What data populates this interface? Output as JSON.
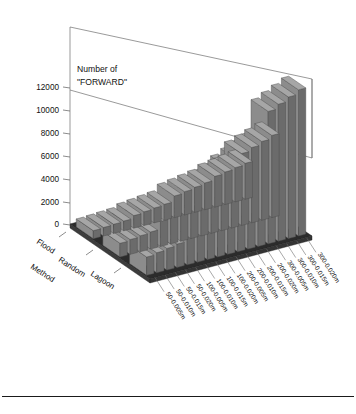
{
  "figure": {
    "background_color": "#ffffff",
    "bar_face_color": "#8c8c8c",
    "bar_top_color": "#a6a6a6",
    "bar_side_color": "#6b6b6b",
    "floor_color": "#2b2b2b",
    "floor_front_color": "#3c3c3c",
    "axis_line_color": "#6f6f6f",
    "text_color": "#111111"
  },
  "chart_data": {
    "type": "bar",
    "title": "",
    "subtitle": "",
    "zlabel": "Number of \"FORWARD\"",
    "zlabel_line1": "Number of",
    "zlabel_line2": "\"FORWARD\"",
    "ylabel": "Method",
    "xlabel": "",
    "grid": false,
    "legend": "none",
    "zlim": [
      0,
      13000
    ],
    "ztick_labels": [
      "0",
      "2000",
      "4000",
      "6000",
      "8000",
      "10000",
      "12000"
    ],
    "ztick_values": [
      0,
      2000,
      4000,
      6000,
      8000,
      10000,
      12000
    ],
    "categories": [
      "50-0.005m",
      "50-0.010m",
      "50-0.015m",
      "50-0.020m",
      "100-0.005m",
      "100-0.010m",
      "100-0.015m",
      "100-0.020m",
      "200-0.005m",
      "200-0.010m",
      "200-0.015m",
      "200-0.020m",
      "300-0.005m",
      "300-0.010m",
      "300-0.015m",
      "300-0.020m"
    ],
    "depth_categories": [
      "Flood",
      "Random",
      "Lagoon"
    ],
    "series": [
      {
        "name": "Flood",
        "values": [
          700,
          750,
          800,
          850,
          1100,
          1200,
          1300,
          1400,
          1900,
          2050,
          2200,
          2350,
          2700,
          2850,
          3000,
          3150
        ]
      },
      {
        "name": "Random",
        "values": [
          1200,
          1300,
          1400,
          1500,
          2200,
          2400,
          2600,
          2800,
          4200,
          4500,
          4800,
          5100,
          6300,
          6600,
          6900,
          7200
        ]
      },
      {
        "name": "Lagoon",
        "values": [
          1600,
          1750,
          1900,
          2050,
          3400,
          3700,
          4000,
          4300,
          7600,
          8000,
          8400,
          8800,
          11600,
          12000,
          12400,
          12800
        ]
      }
    ]
  }
}
